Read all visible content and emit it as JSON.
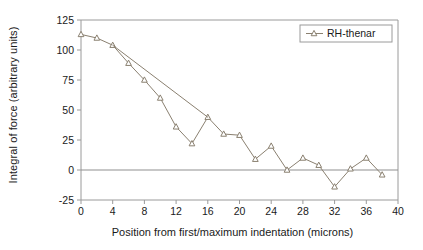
{
  "chart_data": {
    "type": "line",
    "title": "",
    "xlabel": "Position from first/maximum indentation (microns)",
    "ylabel": "Integral of force (arbitrary units)",
    "xlim": [
      0,
      40
    ],
    "ylim": [
      -25,
      125
    ],
    "xticks": [
      0,
      4,
      8,
      12,
      16,
      20,
      24,
      28,
      32,
      36,
      40
    ],
    "yticks": [
      -25,
      0,
      25,
      50,
      75,
      100,
      125
    ],
    "xtick_labels": [
      "0",
      "4",
      "8",
      "12",
      "16",
      "20",
      "24",
      "28",
      "32",
      "36",
      "40"
    ],
    "ytick_labels": [
      "-25",
      "0",
      "25",
      "50",
      "75",
      "100",
      "125"
    ],
    "grid": false,
    "zero_line": 0,
    "legend_position": "top-right",
    "marker": "triangle-open",
    "series_color": "#8a8070",
    "series": [
      {
        "name": "RH-thenar",
        "x": [
          0,
          2,
          4,
          6,
          8,
          10,
          12,
          14,
          16,
          18,
          20,
          22,
          24,
          26,
          28,
          30,
          32,
          34,
          36,
          38
        ],
        "values": [
          113,
          110,
          104,
          89,
          75,
          60,
          36,
          22,
          44,
          30,
          29,
          9,
          20,
          0,
          10,
          4,
          -14,
          1,
          10,
          -4
        ]
      },
      {
        "name": "RH-thenar-connector",
        "x": [
          4,
          16
        ],
        "values": [
          104,
          44
        ],
        "markers": false
      }
    ]
  },
  "legend": {
    "entries": [
      {
        "label": "RH-thenar",
        "marker": "triangle-open",
        "color": "#8a8070"
      }
    ]
  },
  "axes": {
    "frame_color": "#9a9a9a",
    "text_color": "#1a1a1a"
  }
}
